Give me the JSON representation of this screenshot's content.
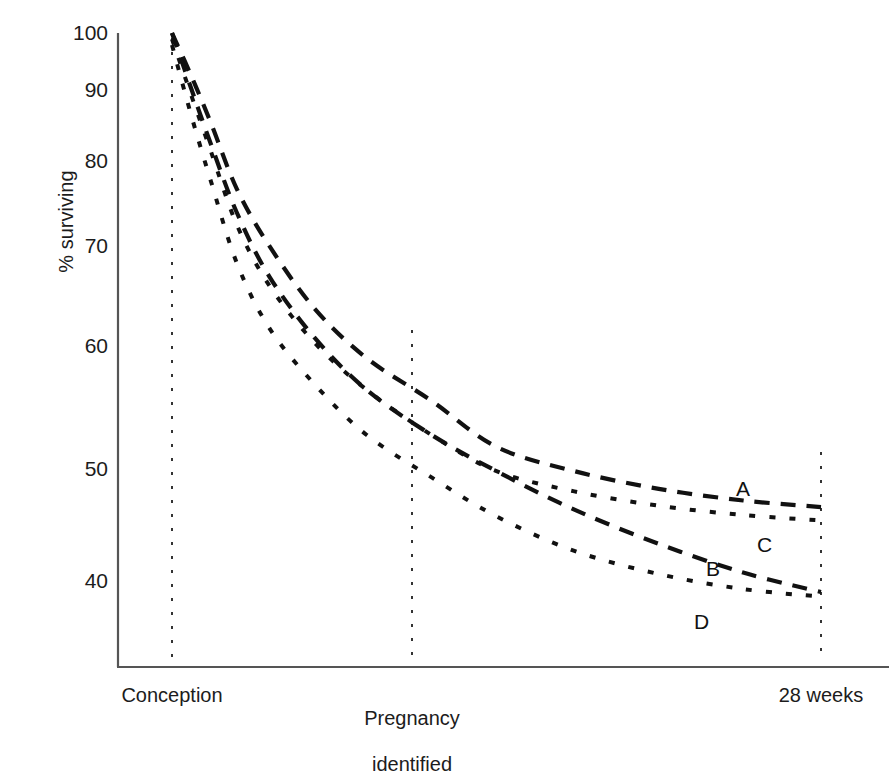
{
  "chart_data": {
    "type": "line",
    "title": "",
    "subtitle": "",
    "xlabel": "",
    "ylabel": "% surviving",
    "yscale": "log",
    "ylim": [
      35,
      100
    ],
    "yticks": [
      100,
      90,
      80,
      70,
      60,
      50,
      40
    ],
    "ytick_labels": [
      "100",
      "90",
      "80",
      "70",
      "60",
      "50",
      "40"
    ],
    "xlim": [
      0,
      100
    ],
    "xticks": [
      0,
      50,
      100
    ],
    "xtick_labels": [
      "Conception",
      "Pregnancy\nidentified",
      "28 weeks"
    ],
    "grid": false,
    "legend": "inline-end-labels",
    "annotations": [
      "A",
      "B",
      "C",
      "D"
    ],
    "x": [
      0,
      3,
      6,
      10,
      15,
      22,
      30,
      40,
      50,
      62,
      75,
      88,
      100
    ],
    "series": [
      {
        "name": "A",
        "label": "A",
        "dash": "long-dash",
        "values": [
          100,
          93,
          86,
          77,
          70,
          63,
          58,
          54,
          50,
          48,
          46.6,
          45.7,
          45.2
        ]
      },
      {
        "name": "B",
        "label": "B",
        "dash": "long-dash",
        "values": [
          100,
          91,
          83,
          74,
          66.5,
          60,
          55,
          51,
          48,
          45,
          42.5,
          40.5,
          39.2
        ]
      },
      {
        "name": "C",
        "label": "C",
        "dash": "dotted",
        "values": [
          99,
          90,
          82,
          72.5,
          65.5,
          59.5,
          55,
          51,
          48,
          46.4,
          45.3,
          44.6,
          44.2
        ]
      },
      {
        "name": "D",
        "label": "D",
        "dash": "dotted",
        "values": [
          98,
          87,
          78,
          68,
          61,
          55.5,
          51,
          47.5,
          44.5,
          42,
          40.4,
          39.4,
          38.9
        ]
      }
    ],
    "reference_lines": [
      {
        "name": "conception",
        "x": 0
      },
      {
        "name": "pregnancy-identified",
        "x": 50
      },
      {
        "name": "28-weeks",
        "x": 100
      }
    ],
    "colors": {
      "ink": "#1a1a1a",
      "axis": "#555555",
      "reference_line": "#333333",
      "background": "#ffffff"
    }
  },
  "axis": {
    "y_title": "% surviving",
    "y_labels": {
      "t100": "100",
      "t90": "90",
      "t80": "80",
      "t70": "70",
      "t60": "60",
      "t50": "50",
      "t40": "40"
    },
    "x_labels": {
      "conception": "Conception",
      "pregnancy_line1": "Pregnancy",
      "pregnancy_line2": "identified",
      "weeks28": "28 weeks"
    }
  },
  "curve_labels": {
    "a": "A",
    "b": "B",
    "c": "C",
    "d": "D"
  }
}
